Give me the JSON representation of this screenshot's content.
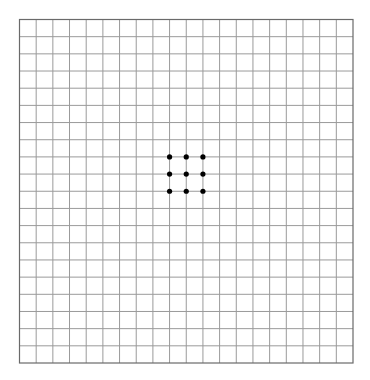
{
  "grid": {
    "left": 19.5,
    "top": 19.5,
    "width": 333.5,
    "height": 343.5,
    "columns": 20,
    "rows": 20,
    "line_color": "#9a9a9a",
    "border_color": "#6a6a6a",
    "background": "#ffffff"
  },
  "dots": {
    "color": "#000000",
    "radius": 2.6,
    "points": [
      {
        "col": 9,
        "row": 8
      },
      {
        "col": 10,
        "row": 8
      },
      {
        "col": 11,
        "row": 8
      },
      {
        "col": 9,
        "row": 9
      },
      {
        "col": 10,
        "row": 9
      },
      {
        "col": 11,
        "row": 9
      },
      {
        "col": 9,
        "row": 10
      },
      {
        "col": 10,
        "row": 10
      },
      {
        "col": 11,
        "row": 10
      }
    ]
  }
}
